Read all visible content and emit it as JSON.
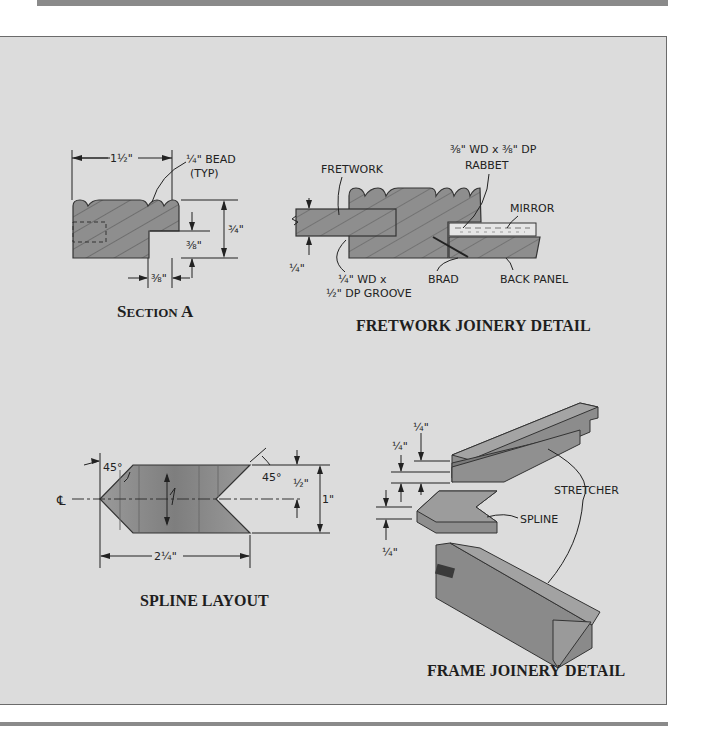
{
  "page": {
    "header_bar": "",
    "footer_rule": ""
  },
  "figures": {
    "section_a": {
      "caption_first": "S",
      "caption_rest": "ECTION ",
      "caption_letter": "A",
      "labels": {
        "width": "1½\"",
        "bead": "¼\" BEAD",
        "bead_typ": "(TYP)",
        "height": "¾\"",
        "rabbet_depth": "⅜\"",
        "rabbet_width": "⅜\""
      }
    },
    "fretwork_joinery": {
      "caption_words": [
        "FRETWORK",
        "JOINERY",
        "DETAIL"
      ],
      "labels": {
        "fretwork": "FRETWORK",
        "rabbet_line1": "⅜\" WD x ⅜\" DP",
        "rabbet_line2": "RABBET",
        "mirror": "MIRROR",
        "thickness": "¼\"",
        "groove_line1": "¼\" WD x",
        "groove_line2": "½\" DP GROOVE",
        "brad": "BRAD",
        "back_panel": "BACK PANEL"
      }
    },
    "spline_layout": {
      "caption_words": [
        "SPLINE",
        "LAYOUT"
      ],
      "labels": {
        "angle_left": "45°",
        "angle_right": "45°",
        "centerline": "℄",
        "half_height": "½\"",
        "full_height": "1\"",
        "length": "2¼\""
      }
    },
    "frame_joinery": {
      "caption_words": [
        "FRAME",
        "JOINERY",
        "DETAIL"
      ],
      "labels": {
        "top_dim": "¼\"",
        "mid_dim": "¼\"",
        "bottom_dim": "¼\"",
        "stretcher": "STRETCHER",
        "spline": "SPLINE"
      }
    }
  },
  "colors": {
    "panel_bg": "#dcdcdc",
    "wood_fill": "#8e8e8e",
    "rule": "#8a8a8a",
    "ink": "#222222"
  }
}
